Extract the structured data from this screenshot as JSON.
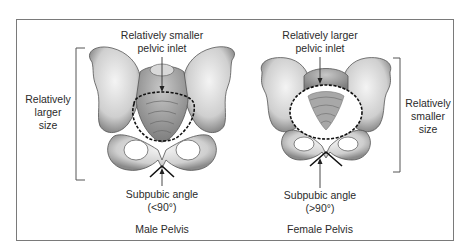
{
  "figure": {
    "male": {
      "inlet_label_line1": "Relatively smaller",
      "inlet_label_line2": "pelvic inlet",
      "size_label_line1": "Relatively",
      "size_label_line2": "larger",
      "size_label_line3": "size",
      "angle_label": "Subpubic angle",
      "angle_value": "(<90°)",
      "caption": "Male Pelvis"
    },
    "female": {
      "inlet_label_line1": "Relatively larger",
      "inlet_label_line2": "pelvic inlet",
      "size_label_line1": "Relatively",
      "size_label_line2": "smaller",
      "size_label_line3": "size",
      "angle_label": "Subpubic angle",
      "angle_value": "(>90°)",
      "caption": "Female Pelvis"
    }
  },
  "colors": {
    "border": "#7a7a7a",
    "bone_fill": "#e4e4e4",
    "bone_shade": "#9a9a9a",
    "outline": "#222222"
  }
}
